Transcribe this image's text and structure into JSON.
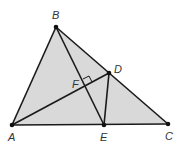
{
  "diagram": {
    "type": "triangle-geometry",
    "fill_color": "#d9d9d9",
    "stroke_color": "#1a1a1a",
    "points": {
      "A": {
        "label": "A",
        "x": 12,
        "y": 125
      },
      "B": {
        "label": "B",
        "x": 56,
        "y": 27
      },
      "C": {
        "label": "C",
        "x": 168,
        "y": 124
      },
      "D": {
        "label": "D",
        "x": 109,
        "y": 73
      },
      "E": {
        "label": "E",
        "x": 104,
        "y": 125
      },
      "F": {
        "label": "F",
        "x": 86,
        "y": 85
      }
    },
    "segments": [
      "AB",
      "BC",
      "AC",
      "BE",
      "AD",
      "DE"
    ],
    "right_angle_at": "F"
  }
}
